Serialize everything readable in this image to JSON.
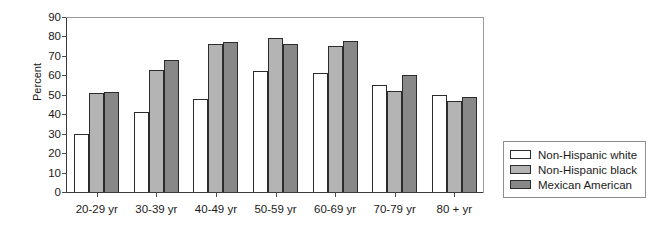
{
  "chart_data": {
    "type": "bar",
    "title": "",
    "subtitle": "",
    "xlabel": "",
    "ylabel": "Percent",
    "ylim": [
      0,
      90
    ],
    "yticks": [
      0,
      10,
      20,
      30,
      40,
      50,
      60,
      70,
      80,
      90
    ],
    "grid": false,
    "legend_position": "right-outside",
    "categories": [
      "20-29 yr",
      "30-39 yr",
      "40-49 yr",
      "50-59 yr",
      "60-69 yr",
      "70-79 yr",
      "80 + yr"
    ],
    "series": [
      {
        "name": "Non-Hispanic white",
        "color": "#ffffff",
        "values": [
          30,
          41,
          48,
          62,
          61,
          55,
          50
        ]
      },
      {
        "name": "Non-Hispanic black",
        "color": "#b4b4b4",
        "values": [
          51,
          63,
          76,
          79,
          75,
          52,
          47
        ]
      },
      {
        "name": "Mexican American",
        "color": "#888888",
        "values": [
          51.5,
          68,
          77,
          76,
          77.5,
          60,
          49
        ]
      }
    ]
  },
  "legend": {
    "items": [
      {
        "label": "Non-Hispanic white"
      },
      {
        "label": "Non-Hispanic black"
      },
      {
        "label": "Mexican American"
      }
    ]
  }
}
